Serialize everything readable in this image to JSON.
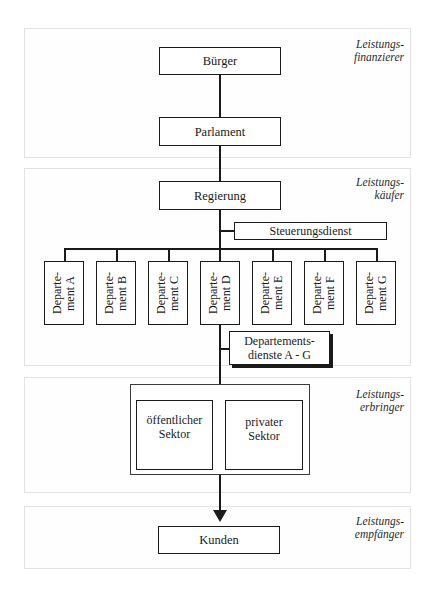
{
  "diagram": {
    "panels": [
      {
        "id": "finanzierer",
        "role": "Leistungs-\nfinanzierer"
      },
      {
        "id": "kaeufer",
        "role": "Leistungs-\nkäufer"
      },
      {
        "id": "erbringer",
        "role": "Leistungs-\nerbringer"
      },
      {
        "id": "empfaenger",
        "role": "Leistungs-\nempfänger"
      }
    ],
    "nodes": {
      "buerger": "Bürger",
      "parlament": "Parlament",
      "regierung": "Regierung",
      "steuerungsdienst": "Steuerungsdienst",
      "departementsdienste": "Departements-\ndienste A - G",
      "oeffentlicher_sektor": "öffentlicher\nSektor",
      "privater_sektor": "privater\nSektor",
      "kunden": "Kunden"
    },
    "departments": [
      {
        "label": "Departe-\nment A"
      },
      {
        "label": "Departe-\nment B"
      },
      {
        "label": "Departe-\nment C"
      },
      {
        "label": "Departe-\nment D"
      },
      {
        "label": "Departe-\nment E"
      },
      {
        "label": "Departe-\nment F"
      },
      {
        "label": "Departe-\nment G"
      }
    ],
    "edges": [
      [
        "Bürger",
        "Parlament"
      ],
      [
        "Parlament",
        "Regierung"
      ],
      [
        "Regierung",
        "Steuerungsdienst"
      ],
      [
        "Regierung",
        "Departement A-G"
      ],
      [
        "Departement D",
        "Departementsdienste A - G"
      ],
      [
        "Departementsdienste A - G",
        "öffentlicher Sektor"
      ],
      [
        "Departementsdienste A - G",
        "privater Sektor"
      ],
      [
        "Leistungserbringer",
        "Kunden"
      ]
    ],
    "colors": {
      "line": "#1a1a1a",
      "panel_border": "#e2e2e2",
      "background": "#ffffff"
    }
  }
}
